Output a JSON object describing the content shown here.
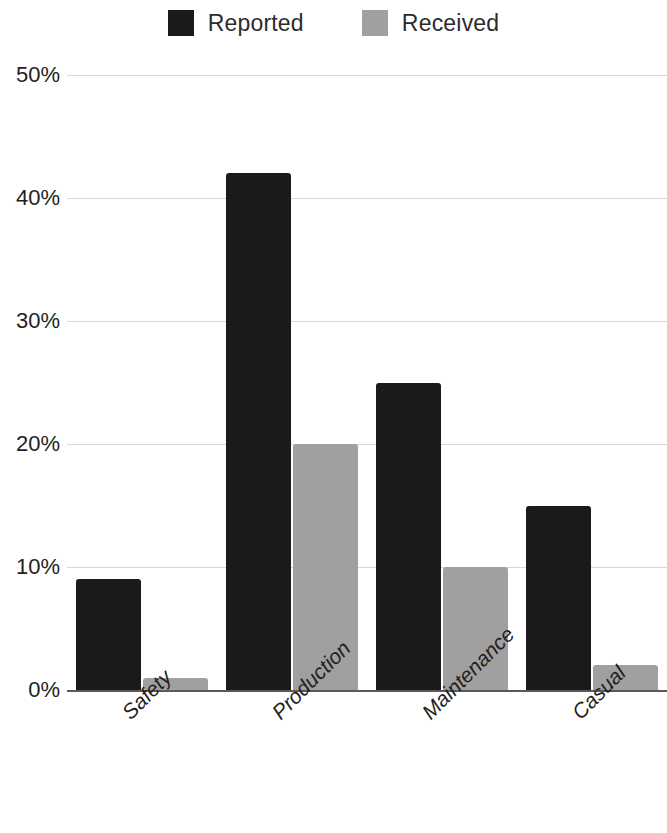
{
  "legend": {
    "position": "top-center",
    "entries": [
      {
        "label": "Reported",
        "color": "#1a1a1a",
        "swatch_name": "legend-swatch-reported"
      },
      {
        "label": "Received",
        "color": "#a0a0a0",
        "swatch_name": "legend-swatch-received"
      }
    ]
  },
  "axes": {
    "y_ticks": [
      "0%",
      "10%",
      "20%",
      "30%",
      "40%",
      "50%"
    ],
    "x_ticks": [
      "Safety",
      "Production",
      "Maintenance",
      "Casual"
    ]
  },
  "chart_data": {
    "type": "bar",
    "title": "",
    "subtitle": "",
    "xlabel": "",
    "ylabel": "",
    "categories": [
      "Safety",
      "Production",
      "Maintenance",
      "Casual"
    ],
    "series": [
      {
        "name": "Reported",
        "color": "#1a1a1a",
        "values": [
          9,
          42,
          25,
          15
        ]
      },
      {
        "name": "Received",
        "color": "#a0a0a0",
        "values": [
          1,
          20,
          10,
          2
        ]
      }
    ],
    "ylim": [
      0,
      50
    ],
    "ytick_values": [
      0,
      10,
      20,
      30,
      40,
      50
    ],
    "ytick_labels": [
      "0%",
      "10%",
      "20%",
      "30%",
      "40%",
      "50%"
    ],
    "yunit": "%",
    "grid": {
      "horizontal": true,
      "vertical": false,
      "color": "#d8d8d8"
    },
    "legend_position": "top-center",
    "xtick_rotation": -45,
    "grouped": true,
    "note": "Right-most Received bar (Casual) is clipped by the image edge"
  }
}
